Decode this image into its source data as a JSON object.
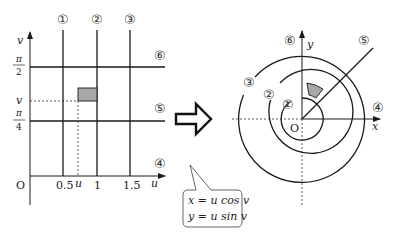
{
  "left_plot": {
    "axis_v_label": "v",
    "axis_u_label": "u",
    "origin_label": "O",
    "u_ticks": [
      "0.5",
      "u",
      "1",
      "1.5"
    ],
    "v_ticks": [
      {
        "num": "π",
        "den": "2"
      },
      {
        "num": "π",
        "den": "4"
      }
    ],
    "v_point_label": "v",
    "line_labels": {
      "one": "①",
      "two": "②",
      "three": "③",
      "four": "④",
      "five": "⑤",
      "six": "⑥"
    },
    "shade_color": "#a8a8a8"
  },
  "transform": {
    "arrow": "right-arrow",
    "equation_x": "x = u cos v",
    "equation_y": "y = u sin v"
  },
  "right_plot": {
    "axis_x_label": "x",
    "axis_y_label": "y",
    "origin_label": "O",
    "line_labels": {
      "one": "①",
      "two": "②",
      "three": "③",
      "four": "④",
      "five": "⑤",
      "six": "⑥"
    },
    "shade_color": "#a8a8a8"
  }
}
